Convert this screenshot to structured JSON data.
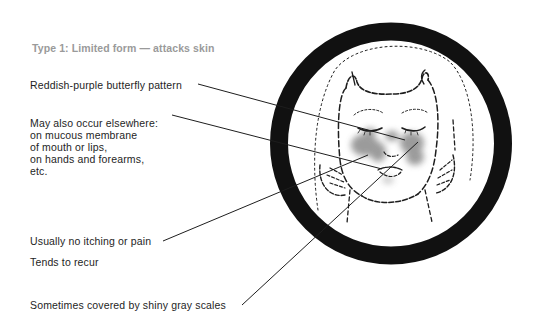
{
  "title": "Type 1: Limited form — attacks skin",
  "labels": {
    "butterfly": "Reddish-purple butterfly pattern",
    "elsewhere": {
      "lines": [
        "May also occur elsewhere:",
        "on mucous membrane",
        "of mouth or lips,",
        "on hands and forearms,",
        "etc."
      ]
    },
    "itching": "Usually no itching or pain",
    "recur": "Tends to recur",
    "scales": "Sometimes covered by shiny gray scales"
  },
  "illustration": {
    "subject": "face-with-butterfly-rash",
    "frame": "thick-black-circle",
    "rash_color": "#8a8a8a",
    "ring_color": "#111111"
  },
  "colors": {
    "title": "#9a9a9a",
    "text": "#1e1e1e",
    "lines": "#1e1e1e"
  }
}
